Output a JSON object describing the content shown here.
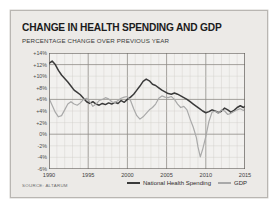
{
  "header": {
    "title": "CHANGE IN HEALTH SPENDING AND GDP",
    "subtitle": "PERCENTAGE CHANGE OVER PREVIOUS YEAR"
  },
  "source": "SOURCE: ALTARUM",
  "legend": [
    {
      "label": "National Health Spending",
      "color": "#3a3a3a"
    },
    {
      "label": "GDP",
      "color": "#a9a9a9"
    }
  ],
  "colors": {
    "panel": "#eceae7",
    "grid_minor": "#cfccc8",
    "grid_major": "#8e8b87",
    "axis": "#5a5753",
    "health": "#3a3a3a",
    "gdp": "#a9a9a9"
  },
  "chart_data": {
    "type": "line",
    "title": "CHANGE IN HEALTH SPENDING AND GDP",
    "subtitle": "PERCENTAGE CHANGE OVER PREVIOUS YEAR",
    "xlabel": "",
    "ylabel": "",
    "xlim": [
      1990,
      2015
    ],
    "ylim": [
      -6,
      14
    ],
    "ytick_step": 2,
    "grid": true,
    "legend_position": "bottom",
    "ytick_labels": [
      "+14%",
      "+12%",
      "+10%",
      "+8%",
      "+6%",
      "+4%",
      "+2%",
      "0%",
      "-2%",
      "-4%",
      "-6%"
    ],
    "ytick_values": [
      14,
      12,
      10,
      8,
      6,
      4,
      2,
      0,
      -2,
      -4,
      -6
    ],
    "xtick_labels": [
      "1990",
      "1995",
      "2000",
      "2005",
      "2010",
      "2015"
    ],
    "xtick_values": [
      1990,
      1995,
      2000,
      2005,
      2010,
      2015
    ],
    "series": [
      {
        "name": "National Health Spending",
        "color": "#3a3a3a",
        "x": [
          1990.0,
          1990.4,
          1990.8,
          1991.2,
          1991.6,
          1992.0,
          1992.4,
          1992.8,
          1993.2,
          1993.6,
          1994.0,
          1994.4,
          1994.8,
          1995.2,
          1995.6,
          1996.0,
          1996.4,
          1996.8,
          1997.2,
          1997.6,
          1998.0,
          1998.4,
          1998.8,
          1999.2,
          1999.6,
          2000.0,
          2000.4,
          2000.8,
          2001.2,
          2001.6,
          2002.0,
          2002.4,
          2002.8,
          2003.2,
          2003.6,
          2004.0,
          2004.4,
          2004.8,
          2005.2,
          2005.6,
          2006.0,
          2006.4,
          2006.8,
          2007.2,
          2007.6,
          2008.0,
          2008.4,
          2008.8,
          2009.2,
          2009.6,
          2010.0,
          2010.4,
          2010.8,
          2011.2,
          2011.6,
          2012.0,
          2012.4,
          2012.8,
          2013.2,
          2013.6,
          2014.0,
          2014.4,
          2014.8,
          2015.0
        ],
        "values": [
          12.2,
          12.6,
          12.0,
          11.0,
          10.2,
          9.6,
          9.0,
          8.3,
          7.6,
          7.2,
          6.8,
          6.2,
          5.6,
          5.3,
          5.6,
          5.2,
          5.0,
          5.3,
          5.1,
          5.4,
          5.2,
          5.5,
          5.3,
          5.8,
          5.5,
          6.0,
          6.4,
          6.9,
          7.6,
          8.3,
          9.1,
          9.5,
          9.2,
          8.6,
          8.4,
          8.0,
          7.6,
          7.3,
          7.0,
          6.9,
          7.1,
          6.9,
          6.6,
          6.3,
          6.0,
          5.6,
          5.2,
          4.8,
          4.4,
          4.0,
          3.7,
          3.9,
          4.2,
          4.0,
          3.7,
          4.0,
          4.5,
          4.2,
          3.8,
          4.1,
          4.6,
          4.9,
          4.6,
          4.8
        ]
      },
      {
        "name": "GDP",
        "color": "#a9a9a9",
        "x": [
          1990.0,
          1990.4,
          1990.8,
          1991.2,
          1991.6,
          1992.0,
          1992.4,
          1992.8,
          1993.2,
          1993.6,
          1994.0,
          1994.4,
          1994.8,
          1995.2,
          1995.6,
          1996.0,
          1996.4,
          1996.8,
          1997.2,
          1997.6,
          1998.0,
          1998.4,
          1998.8,
          1999.2,
          1999.6,
          2000.0,
          2000.4,
          2000.8,
          2001.2,
          2001.6,
          2002.0,
          2002.4,
          2002.8,
          2003.2,
          2003.6,
          2004.0,
          2004.4,
          2004.8,
          2005.2,
          2005.6,
          2006.0,
          2006.4,
          2006.8,
          2007.2,
          2007.6,
          2008.0,
          2008.4,
          2008.8,
          2009.0,
          2009.3,
          2009.6,
          2010.0,
          2010.4,
          2010.8,
          2011.2,
          2011.6,
          2012.0,
          2012.4,
          2012.8,
          2013.2,
          2013.6,
          2014.0,
          2014.4,
          2014.8,
          2015.0
        ],
        "values": [
          6.2,
          5.0,
          3.8,
          3.0,
          3.2,
          4.2,
          5.2,
          5.6,
          5.2,
          5.0,
          5.4,
          6.0,
          6.2,
          5.6,
          4.8,
          5.2,
          5.8,
          6.0,
          6.3,
          6.1,
          5.6,
          5.4,
          5.8,
          6.2,
          6.4,
          6.5,
          5.8,
          4.4,
          3.2,
          2.6,
          3.0,
          3.6,
          4.2,
          4.6,
          5.2,
          6.2,
          6.6,
          6.4,
          6.3,
          6.5,
          6.0,
          5.2,
          4.6,
          4.8,
          4.2,
          2.6,
          1.2,
          -0.6,
          -2.2,
          -3.9,
          -2.6,
          -0.4,
          2.2,
          3.8,
          4.0,
          3.6,
          4.2,
          4.0,
          3.4,
          3.6,
          3.9,
          4.2,
          4.4,
          4.1,
          4.3
        ]
      }
    ]
  }
}
